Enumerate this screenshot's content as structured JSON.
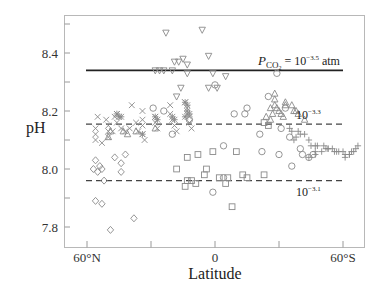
{
  "chart_data": {
    "type": "scatter",
    "title": "",
    "xlabel": "Latitude",
    "ylabel": "pH",
    "x_direction": "60°N (left) to 60°S (right); north latitudes positive",
    "xlim": [
      70,
      -72
    ],
    "ylim": [
      7.73,
      8.52
    ],
    "grid": false,
    "legend": null,
    "x_ticks": [
      {
        "value": 60,
        "label": "60°N"
      },
      {
        "value": 30,
        "label": ""
      },
      {
        "value": 0,
        "label": "0"
      },
      {
        "value": -30,
        "label": ""
      },
      {
        "value": -60,
        "label": "60°S"
      }
    ],
    "y_ticks": [
      {
        "value": 8.5,
        "label": ""
      },
      {
        "value": 8.4,
        "label": "8.4"
      },
      {
        "value": 8.3,
        "label": ""
      },
      {
        "value": 8.2,
        "label": "8.2"
      },
      {
        "value": 8.1,
        "label": ""
      },
      {
        "value": 8.0,
        "label": "8.0"
      },
      {
        "value": 7.9,
        "label": ""
      },
      {
        "value": 7.8,
        "label": "7.8"
      }
    ],
    "reference_lines": [
      {
        "name": "pCO2 = 10^-3.5 atm",
        "y": 8.34,
        "style": "solid",
        "x_from": 60,
        "x_to": -60,
        "label_main": "P",
        "label_sub": "CO",
        "label_sub2": "2",
        "label_rest": " = 10",
        "label_exp": "−3.5",
        "label_unit": " atm"
      },
      {
        "name": "pCO2 = 10^-3.3 atm",
        "y": 8.155,
        "style": "dashed",
        "x_from": 60,
        "x_to": -60,
        "label_base": "10",
        "label_exp": "−3.3"
      },
      {
        "name": "pCO2 = 10^-3.1 atm",
        "y": 7.96,
        "style": "dashed",
        "x_from": 60,
        "x_to": -60,
        "label_base": "10",
        "label_exp": "−3.1"
      }
    ],
    "series": [
      {
        "name": "inverted-triangles",
        "marker": "triangle-down",
        "points": [
          [
            23,
            8.47
          ],
          [
            28,
            8.34
          ],
          [
            26,
            8.34
          ],
          [
            24,
            8.34
          ],
          [
            20,
            8.34
          ],
          [
            17,
            8.37
          ],
          [
            19,
            8.37
          ],
          [
            15,
            8.38
          ],
          [
            13,
            8.36
          ],
          [
            13,
            8.33
          ],
          [
            16,
            8.28
          ],
          [
            18,
            8.25
          ],
          [
            6,
            8.48
          ],
          [
            3,
            8.39
          ],
          [
            1,
            8.33
          ],
          [
            -5,
            8.32
          ],
          [
            3,
            8.28
          ],
          [
            -1,
            8.28
          ]
        ]
      },
      {
        "name": "x-crosses",
        "marker": "x",
        "points": [
          [
            55,
            8.18
          ],
          [
            56,
            8.14
          ],
          [
            56,
            8.12
          ],
          [
            56,
            8.1
          ],
          [
            51,
            8.17
          ],
          [
            50,
            8.15
          ],
          [
            50,
            8.13
          ],
          [
            50,
            8.11
          ],
          [
            47,
            8.18
          ],
          [
            46,
            8.16
          ],
          [
            46,
            8.19
          ],
          [
            44,
            8.14
          ],
          [
            42,
            8.13
          ],
          [
            40,
            8.14
          ],
          [
            39,
            8.22
          ],
          [
            37,
            8.16
          ],
          [
            36,
            8.13
          ],
          [
            34,
            8.2
          ],
          [
            34,
            8.17
          ],
          [
            34,
            8.15
          ],
          [
            34,
            8.12
          ],
          [
            33,
            8.1
          ],
          [
            28,
            8.18
          ],
          [
            28,
            8.16
          ],
          [
            27,
            8.14
          ],
          [
            21,
            8.22
          ],
          [
            21,
            8.19
          ],
          [
            20,
            8.17
          ],
          [
            19,
            8.15
          ],
          [
            18,
            8.13
          ],
          [
            14,
            8.23
          ],
          [
            13,
            8.21
          ],
          [
            13,
            8.19
          ],
          [
            12,
            8.18
          ],
          [
            12,
            8.16
          ],
          [
            11,
            8.14
          ],
          [
            53,
            8.09
          ],
          [
            48,
            8.13
          ]
        ]
      },
      {
        "name": "asterisks",
        "marker": "asterisk",
        "points": [
          [
            46,
            8.19
          ],
          [
            45,
            8.18
          ],
          [
            44,
            8.18
          ],
          [
            34,
            8.12
          ],
          [
            28,
            8.18
          ],
          [
            27,
            8.17
          ],
          [
            20,
            8.18
          ],
          [
            19,
            8.17
          ],
          [
            14,
            8.23
          ],
          [
            13,
            8.22
          ],
          [
            13,
            8.2
          ],
          [
            12,
            8.19
          ],
          [
            14,
            8.18
          ]
        ]
      },
      {
        "name": "circles",
        "marker": "circle",
        "points": [
          [
            29,
            8.21
          ],
          [
            24,
            8.2
          ],
          [
            20,
            8.12
          ],
          [
            12,
            8.17
          ],
          [
            0,
            8.29
          ],
          [
            -9,
            8.19
          ],
          [
            -15,
            8.21
          ],
          [
            -25,
            8.25
          ],
          [
            -29,
            8.33
          ],
          [
            -21,
            8.12
          ],
          [
            -31,
            8.14
          ],
          [
            -35,
            8.11
          ],
          [
            -4,
            8.08
          ],
          [
            -14,
            8.19
          ],
          [
            -33,
            8.21
          ],
          [
            -22,
            8.06
          ],
          [
            -30,
            8.05
          ],
          [
            -40,
            8.07
          ],
          [
            -41,
            8.05
          ],
          [
            -44,
            8.04
          ],
          [
            -36,
            8.01
          ],
          [
            -4,
            7.97
          ],
          [
            -46,
            8.05
          ],
          [
            1,
            7.92
          ]
        ]
      },
      {
        "name": "triangles",
        "marker": "triangle-up",
        "points": [
          [
            49,
            8.13
          ],
          [
            50,
            8.11
          ],
          [
            43,
            8.13
          ],
          [
            41,
            8.12
          ],
          [
            37,
            8.13
          ],
          [
            28,
            8.14
          ],
          [
            -28,
            8.26
          ],
          [
            -28,
            8.24
          ],
          [
            -33,
            8.23
          ],
          [
            -26,
            8.21
          ],
          [
            -27,
            8.19
          ],
          [
            -28,
            8.22
          ],
          [
            -29,
            8.21
          ],
          [
            -30,
            8.2
          ],
          [
            -31,
            8.19
          ],
          [
            -32,
            8.18
          ],
          [
            -33,
            8.22
          ],
          [
            -36,
            8.22
          ],
          [
            -37,
            8.2
          ],
          [
            -38,
            8.2
          ],
          [
            -39,
            8.19
          ],
          [
            -42,
            8.17
          ],
          [
            -24,
            8.18
          ],
          [
            -26,
            8.17
          ]
        ]
      },
      {
        "name": "squares",
        "marker": "square",
        "points": [
          [
            -23,
            8.16
          ],
          [
            -25,
            8.15
          ],
          [
            -10,
            8.06
          ],
          [
            1,
            8.06
          ],
          [
            8,
            8.05
          ],
          [
            13,
            8.04
          ],
          [
            18,
            8.0
          ],
          [
            4,
            8.0
          ],
          [
            13,
            7.96
          ],
          [
            11,
            7.96
          ],
          [
            9,
            7.95
          ],
          [
            14,
            7.94
          ],
          [
            5,
            7.98
          ],
          [
            -2,
            7.97
          ],
          [
            -6,
            7.97
          ],
          [
            -13,
            7.98
          ],
          [
            -15,
            7.97
          ],
          [
            -23,
            7.98
          ],
          [
            -5,
            7.95
          ],
          [
            -8,
            7.87
          ]
        ]
      },
      {
        "name": "diamonds",
        "marker": "diamond",
        "points": [
          [
            56,
            8.03
          ],
          [
            55,
            7.99
          ],
          [
            53,
            8.0
          ],
          [
            52,
            7.96
          ],
          [
            56,
            7.89
          ],
          [
            53,
            7.88
          ],
          [
            47,
            8.04
          ],
          [
            44,
            8.02
          ],
          [
            44,
            7.99
          ],
          [
            42,
            8.05
          ],
          [
            38,
            7.83
          ],
          [
            49,
            7.79
          ],
          [
            54,
            8.01
          ],
          [
            57,
            8.0
          ]
        ]
      },
      {
        "name": "plus-signs",
        "marker": "plus",
        "points": [
          [
            -35,
            8.14
          ],
          [
            -36,
            8.13
          ],
          [
            -38,
            8.11
          ],
          [
            -40,
            8.12
          ],
          [
            -37,
            8.1
          ],
          [
            -42,
            8.12
          ],
          [
            -44,
            8.1
          ],
          [
            -45,
            8.08
          ],
          [
            -47,
            8.08
          ],
          [
            -48,
            8.08
          ],
          [
            -47,
            8.06
          ],
          [
            -50,
            8.06
          ],
          [
            -52,
            8.07
          ],
          [
            -53,
            8.07
          ],
          [
            -55,
            8.07
          ],
          [
            -56,
            8.06
          ],
          [
            -57,
            8.06
          ],
          [
            -58,
            8.06
          ],
          [
            -60,
            8.06
          ],
          [
            -61,
            8.05
          ],
          [
            -63,
            8.05
          ],
          [
            -64,
            8.06
          ],
          [
            -65,
            8.06
          ],
          [
            -66,
            8.07
          ],
          [
            -67,
            8.08
          ],
          [
            -61,
            8.04
          ],
          [
            -63,
            8.05
          ],
          [
            -39,
            8.13
          ],
          [
            -51,
            8.08
          ],
          [
            -53,
            8.07
          ],
          [
            -44,
            8.04
          ],
          [
            -47,
            8.05
          ]
        ]
      }
    ],
    "marker_color": "#8a8a8a",
    "line_color": "#222222"
  }
}
